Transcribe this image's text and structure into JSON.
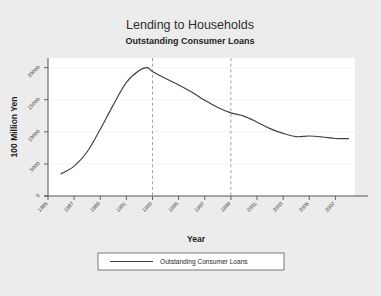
{
  "figure": {
    "background_color": "#ececec",
    "plot_background_color": "#ffffff",
    "title": "Lending to Households",
    "subtitle": "Outstanding Consumer Loans"
  },
  "axes": {
    "x_title": "Year",
    "y_title": "100 Million Yen",
    "x_tick_labels": [
      "1985",
      "1987",
      "1989",
      "1991",
      "1993",
      "1995",
      "1997",
      "1999",
      "2001",
      "2003",
      "2005",
      "2007"
    ],
    "y_tick_labels": [
      "0",
      "5000",
      "10000",
      "15000",
      "20000"
    ]
  },
  "legend": {
    "entries": [
      {
        "label": "Outstanding Consumer Loans",
        "color": "#404040"
      }
    ]
  },
  "chart_data": {
    "type": "line",
    "title": "Lending to Households",
    "subtitle": "Outstanding Consumer Loans",
    "xlabel": "Year",
    "ylabel": "100 Million Yen",
    "xlim": [
      1985,
      2008.5
    ],
    "ylim": [
      0,
      21500
    ],
    "x_ticks": [
      1985,
      1987,
      1989,
      1991,
      1993,
      1995,
      1997,
      1999,
      2001,
      2003,
      2005,
      2007
    ],
    "y_ticks": [
      0,
      5000,
      10000,
      15000,
      20000
    ],
    "grid": "horizontal",
    "legend_position": "bottom",
    "line_color": "#404040",
    "reference_lines": [
      {
        "x": 1993,
        "style": "dashed",
        "color": "#999999"
      },
      {
        "x": 1999,
        "style": "dashed",
        "color": "#999999"
      }
    ],
    "series": [
      {
        "name": "Outstanding Consumer Loans",
        "color": "#404040",
        "x": [
          1986,
          1987,
          1988,
          1989,
          1990,
          1991,
          1992,
          1992.6,
          1993,
          1994,
          1995,
          1996,
          1997,
          1998,
          1999,
          2000,
          2001,
          2002,
          2003,
          2004,
          2005,
          2006,
          2007,
          2008
        ],
        "values": [
          3450,
          4650,
          6900,
          10400,
          14200,
          17700,
          19600,
          20000,
          19400,
          18300,
          17300,
          16200,
          14900,
          13800,
          12950,
          12450,
          11500,
          10500,
          9750,
          9250,
          9350,
          9200,
          8950,
          8950
        ]
      }
    ]
  }
}
